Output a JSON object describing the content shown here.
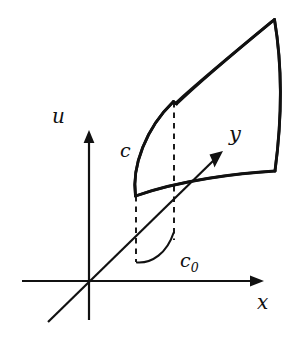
{
  "figure": {
    "type": "mathematical-diagram",
    "background_color": "#ffffff",
    "stroke_color": "#111111"
  },
  "axes": [
    {
      "id": "u",
      "label": "u",
      "orientation": "vertical",
      "direction": "up"
    },
    {
      "id": "y",
      "label": "y",
      "orientation": "diagonal",
      "direction": "up-right"
    },
    {
      "id": "x",
      "label": "x",
      "orientation": "horizontal",
      "direction": "right"
    }
  ],
  "labels": {
    "u_axis": "u",
    "y_axis": "y",
    "x_axis": "x",
    "curve_c": "c",
    "curve_c0_base": "c",
    "curve_c0_sub": "0"
  },
  "surface": {
    "name": "curved-surface-patch",
    "corners": {
      "bottom_left": "(135, 196)",
      "top_left": "(174, 101)",
      "top_right": "(275, 19)",
      "bottom_right": "(275, 171)"
    },
    "fill": "none",
    "stroke_width": "2.6"
  },
  "dashed_lines": [
    {
      "name": "dashed-projection-left",
      "from": "(136, 196)",
      "to": "(136, 262)"
    },
    {
      "name": "dashed-projection-right",
      "from": "(174, 102)",
      "to": "(174, 240)"
    }
  ],
  "arc": {
    "name": "angle-arc",
    "from": "(137, 262)",
    "to": "(173, 233)"
  }
}
